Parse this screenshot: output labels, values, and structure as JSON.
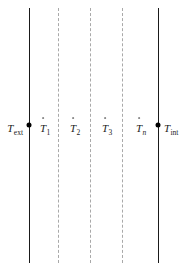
{
  "figure": {
    "type": "layered-wall-thermal-network-schematic",
    "width": 185,
    "height": 273,
    "background_color": "#ffffff",
    "solid_line_color": "#1a1a1a",
    "dashed_line_color": "#a9a9a9",
    "node_dot_color": "#000000"
  },
  "boundaries": [
    {
      "id": "exterior-surface",
      "style": "solid",
      "x": 29,
      "has_node_dot": true,
      "node_dot_y": 125
    },
    {
      "id": "interior-surface",
      "style": "solid",
      "x": 158,
      "has_node_dot": true,
      "node_dot_y": 125
    }
  ],
  "interfaces": [
    {
      "id": "interface-1",
      "style": "dashed",
      "x": 58
    },
    {
      "id": "interface-2",
      "style": "dashed",
      "x": 90
    },
    {
      "id": "interface-3",
      "style": "dashed",
      "x": 122
    }
  ],
  "labels": {
    "exterior": {
      "symbol": "T",
      "subscript": "ext",
      "subscript_italic": false,
      "has_dot_accent": false,
      "x": 15,
      "y": 128
    },
    "interior": {
      "symbol": "T",
      "subscript": "int",
      "subscript_italic": false,
      "has_dot_accent": false,
      "x": 171,
      "y": 128
    },
    "nodes": [
      {
        "symbol": "T",
        "subscript": "1",
        "subscript_italic": false,
        "has_dot_accent": true,
        "x": 45,
        "y": 128
      },
      {
        "symbol": "T",
        "subscript": "2",
        "subscript_italic": false,
        "has_dot_accent": true,
        "x": 75,
        "y": 128
      },
      {
        "symbol": "T",
        "subscript": "3",
        "subscript_italic": false,
        "has_dot_accent": true,
        "x": 107,
        "y": 128
      },
      {
        "symbol": "T",
        "subscript": "n",
        "subscript_italic": true,
        "has_dot_accent": true,
        "x": 141,
        "y": 128
      }
    ]
  }
}
